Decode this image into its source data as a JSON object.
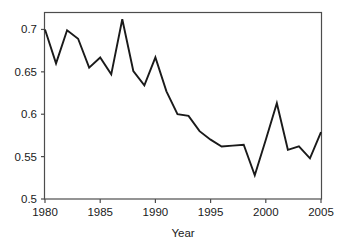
{
  "chart_data": {
    "type": "line",
    "title": "",
    "xlabel": "Year",
    "ylabel": "",
    "x": [
      1980,
      1981,
      1982,
      1983,
      1984,
      1985,
      1986,
      1987,
      1988,
      1989,
      1990,
      1991,
      1992,
      1993,
      1994,
      1995,
      1996,
      1997,
      1998,
      1999,
      2000,
      2001,
      2002,
      2003,
      2004,
      2005
    ],
    "values": [
      0.7,
      0.66,
      0.699,
      0.689,
      0.655,
      0.667,
      0.647,
      0.712,
      0.651,
      0.634,
      0.667,
      0.627,
      0.6,
      0.598,
      0.58,
      0.57,
      0.562,
      0.563,
      0.564,
      0.528,
      0.57,
      0.613,
      0.558,
      0.562,
      0.548,
      0.579
    ],
    "series": [
      {
        "name": "series-1",
        "values": [
          0.7,
          0.66,
          0.699,
          0.689,
          0.655,
          0.667,
          0.647,
          0.712,
          0.651,
          0.634,
          0.667,
          0.627,
          0.6,
          0.598,
          0.58,
          0.57,
          0.562,
          0.563,
          0.564,
          0.528,
          0.57,
          0.613,
          0.558,
          0.562,
          0.548,
          0.579
        ]
      }
    ],
    "xlim": [
      1980,
      2005
    ],
    "ylim": [
      0.5,
      0.72
    ],
    "xticks": [
      1980,
      1985,
      1990,
      1995,
      2000,
      2005
    ],
    "xtick_labels": [
      "1980",
      "1985",
      "1990",
      "1995",
      "2000",
      "2005"
    ],
    "yticks": [
      0.5,
      0.55,
      0.6,
      0.65,
      0.7
    ],
    "ytick_labels": [
      "0.5",
      "0.55",
      "0.6",
      "0.65",
      "0.7"
    ],
    "grid": false,
    "legend": false,
    "line_color": "#1a1a1a",
    "frame_color": "#4d4d4d",
    "background": "#ffffff"
  },
  "axes": {
    "x_title": "Year",
    "y_title": ""
  }
}
